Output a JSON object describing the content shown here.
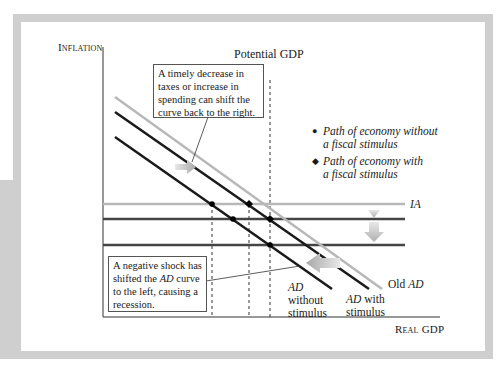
{
  "diagram": {
    "y_axis_label": "Inflation",
    "x_axis_label": "Real GDP",
    "potential_gdp_label": "Potential GDP",
    "ia_label": "IA",
    "curves": {
      "old_ad": {
        "prefix": "Old ",
        "name": "AD",
        "color": "#b8b8b8"
      },
      "ad_with": {
        "name": "AD",
        "suffix": " with",
        "line2": "stimulus",
        "color": "#1a1a1a"
      },
      "ad_without": {
        "name": "AD",
        "line2": "without",
        "line3": "stimulus",
        "color": "#1a1a1a"
      }
    },
    "horizontal_lines": [
      {
        "name": "IA (initial)",
        "color": "#b8b8b8"
      },
      {
        "name": "IA (middle)",
        "color": "#444444"
      },
      {
        "name": "IA (lower)",
        "color": "#444444"
      }
    ],
    "callout_top": {
      "lines": [
        "A timely decrease in",
        "taxes or increase in",
        "spending can shift the",
        "curve back to the right."
      ]
    },
    "callout_bottom": {
      "line1": "A negative shock has",
      "line2_pre": "shifted the ",
      "line2_it": "AD",
      "line2_post": " curve",
      "line3": "to the left, causing a",
      "line4": "recession."
    },
    "legend": {
      "items": [
        {
          "symbol": "circle",
          "line1": "Path of economy without",
          "line2": "a fiscal stimulus"
        },
        {
          "symbol": "diamond",
          "line1": "Path of economy with",
          "line2": "a fiscal stimulus"
        }
      ]
    },
    "icons": {
      "circle": "●",
      "diamond": "◆"
    }
  }
}
